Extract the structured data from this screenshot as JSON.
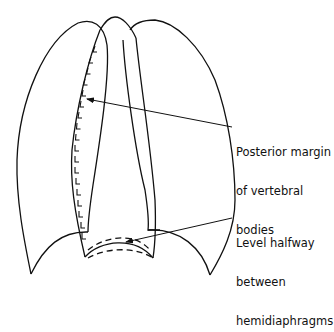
{
  "diagram": {
    "stroke_color": "#111111",
    "background": "#ffffff"
  },
  "labels": {
    "posterior_margin": {
      "lines": [
        "Posterior margin",
        "of vertebral",
        "bodies"
      ]
    },
    "level_halfway": {
      "lines": [
        "Level halfway",
        "between",
        "hemidiaphragms"
      ]
    }
  }
}
